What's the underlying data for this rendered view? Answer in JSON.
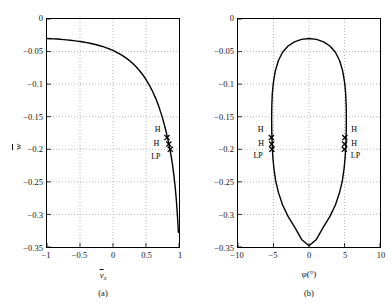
{
  "figure": {
    "background": "#ffffff",
    "curve_color": "#000000",
    "grid_color": "#9a9a9a",
    "axis_color": "#000000"
  },
  "panels": [
    {
      "id": "a",
      "caption": "(a)",
      "xlabel_base": "v",
      "xlabel_sub": "x",
      "ylabel_base": "w",
      "x_ticks": [
        "-1",
        "-0.5",
        "0",
        "0.5",
        "1"
      ],
      "x_tick_values": [
        -1,
        -0.5,
        0,
        0.5,
        1
      ],
      "y_ticks": [
        "0",
        "-0.05",
        "-0.1",
        "-0.15",
        "-0.2",
        "-0.25",
        "-0.3",
        "-0.35"
      ],
      "y_tick_values": [
        0,
        -0.05,
        -0.1,
        -0.15,
        -0.2,
        -0.25,
        -0.3,
        -0.35
      ],
      "markers": [
        {
          "label": "H",
          "x": 0.818,
          "y": -0.182,
          "label_dx": -13,
          "label_dy": -12
        },
        {
          "label": "H",
          "x": 0.845,
          "y": -0.192,
          "label_dx": -16,
          "label_dy": -4
        },
        {
          "label": "LP",
          "x": 0.868,
          "y": -0.2,
          "label_dx": -20,
          "label_dy": 4
        }
      ]
    },
    {
      "id": "b",
      "caption": "(b)",
      "xlabel_base": "φ",
      "xlabel_unit": "(°)",
      "ylabel_base": "w",
      "x_ticks": [
        "-10",
        "-5",
        "0",
        "5",
        "10"
      ],
      "x_tick_values": [
        -10,
        -5,
        0,
        5,
        10
      ],
      "y_ticks": [
        "0",
        "-0.05",
        "-0.1",
        "-0.15",
        "-0.2",
        "-0.25",
        "-0.3",
        "-0.35"
      ],
      "y_tick_values": [
        0,
        -0.05,
        -0.1,
        -0.15,
        -0.2,
        -0.25,
        -0.3,
        -0.35
      ],
      "markers": [
        {
          "label": "H",
          "x": -5.3,
          "y": -0.182,
          "label_dx": -13,
          "label_dy": -12
        },
        {
          "label": "H",
          "x": -5.26,
          "y": -0.192,
          "label_dx": -13,
          "label_dy": -4
        },
        {
          "label": "LP",
          "x": -5.22,
          "y": -0.2,
          "label_dx": -18,
          "label_dy": 3
        },
        {
          "label": "H",
          "x": 5.05,
          "y": -0.182,
          "label_dx": 6,
          "label_dy": -12
        },
        {
          "label": "H",
          "x": 5.02,
          "y": -0.192,
          "label_dx": 6,
          "label_dy": -4
        },
        {
          "label": "LP",
          "x": 4.98,
          "y": -0.2,
          "label_dx": 6,
          "label_dy": 3
        }
      ]
    }
  ],
  "chart_data": [
    {
      "type": "line",
      "panel": "a",
      "title": "",
      "xlabel": "v̄_x",
      "ylabel": "w̄",
      "xlim": [
        -1,
        1
      ],
      "ylim": [
        -0.35,
        0
      ],
      "grid": true,
      "legend": "none",
      "series": [
        {
          "name": "equilibrium-branch",
          "x": [
            -1.0,
            -0.95,
            -0.9,
            -0.85,
            -0.8,
            -0.75,
            -0.7,
            -0.65,
            -0.6,
            -0.55,
            -0.5,
            -0.45,
            -0.4,
            -0.35,
            -0.3,
            -0.25,
            -0.2,
            -0.15,
            -0.1,
            -0.05,
            0.0,
            0.05,
            0.1,
            0.15,
            0.2,
            0.25,
            0.3,
            0.35,
            0.4,
            0.45,
            0.5,
            0.55,
            0.6,
            0.65,
            0.7,
            0.75,
            0.8,
            0.85,
            0.88,
            0.9,
            0.92,
            0.94,
            0.95,
            0.96,
            0.97,
            0.975,
            0.98,
            0.985,
            0.99
          ],
          "y": [
            -0.03,
            -0.0302,
            -0.0305,
            -0.0308,
            -0.0312,
            -0.0316,
            -0.0321,
            -0.0326,
            -0.0332,
            -0.0339,
            -0.0346,
            -0.0354,
            -0.0363,
            -0.0373,
            -0.0384,
            -0.0396,
            -0.041,
            -0.0425,
            -0.0442,
            -0.0461,
            -0.0483,
            -0.0507,
            -0.0534,
            -0.0565,
            -0.06,
            -0.0639,
            -0.0683,
            -0.0733,
            -0.079,
            -0.0855,
            -0.0929,
            -0.1014,
            -0.1112,
            -0.1226,
            -0.136,
            -0.1518,
            -0.1707,
            -0.1937,
            -0.2098,
            -0.2225,
            -0.2376,
            -0.2558,
            -0.2665,
            -0.2786,
            -0.2924,
            -0.3001,
            -0.3084,
            -0.3175,
            -0.3275
          ]
        }
      ],
      "annotations": [
        {
          "text": "H",
          "x": 0.818,
          "y": -0.182,
          "marker": "x"
        },
        {
          "text": "H",
          "x": 0.845,
          "y": -0.192,
          "marker": "x"
        },
        {
          "text": "LP",
          "x": 0.868,
          "y": -0.2,
          "marker": "x"
        }
      ]
    },
    {
      "type": "line",
      "panel": "b",
      "title": "",
      "xlabel": "φ(°)",
      "ylabel": "w̄",
      "xlim": [
        -10,
        10
      ],
      "ylim": [
        -0.35,
        0
      ],
      "grid": true,
      "legend": "none",
      "series": [
        {
          "name": "closed-equilibrium-loop",
          "closed": true,
          "x": [
            0.0,
            1.05,
            2.05,
            2.95,
            3.72,
            4.32,
            4.75,
            5.02,
            5.17,
            5.24,
            5.26,
            5.24,
            5.19,
            5.1,
            4.95,
            4.7,
            4.3,
            3.72,
            2.95,
            2.0,
            1.0,
            0.0,
            -1.0,
            -2.0,
            -2.95,
            -3.72,
            -4.3,
            -4.7,
            -4.95,
            -5.1,
            -5.19,
            -5.24,
            -5.26,
            -5.24,
            -5.17,
            -5.02,
            -4.75,
            -4.32,
            -3.72,
            -2.95,
            -2.05,
            -1.05
          ],
          "y": [
            -0.03,
            -0.0312,
            -0.035,
            -0.0415,
            -0.051,
            -0.064,
            -0.08,
            -0.0975,
            -0.115,
            -0.134,
            -0.154,
            -0.174,
            -0.193,
            -0.211,
            -0.229,
            -0.248,
            -0.2665,
            -0.2855,
            -0.303,
            -0.32,
            -0.339,
            -0.348,
            -0.339,
            -0.32,
            -0.303,
            -0.2855,
            -0.2665,
            -0.248,
            -0.229,
            -0.211,
            -0.193,
            -0.174,
            -0.154,
            -0.134,
            -0.115,
            -0.0975,
            -0.08,
            -0.064,
            -0.051,
            -0.0415,
            -0.035,
            -0.0312
          ]
        }
      ],
      "annotations": [
        {
          "text": "H",
          "x": -5.3,
          "y": -0.182,
          "marker": "x"
        },
        {
          "text": "H",
          "x": -5.26,
          "y": -0.192,
          "marker": "x"
        },
        {
          "text": "LP",
          "x": -5.22,
          "y": -0.2,
          "marker": "x"
        },
        {
          "text": "H",
          "x": 5.05,
          "y": -0.182,
          "marker": "x"
        },
        {
          "text": "H",
          "x": 5.02,
          "y": -0.192,
          "marker": "x"
        },
        {
          "text": "LP",
          "x": 4.98,
          "y": -0.2,
          "marker": "x"
        }
      ]
    }
  ]
}
